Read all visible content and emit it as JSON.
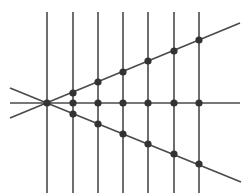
{
  "canvas": {
    "width": 248,
    "height": 196,
    "background": "#ffffff"
  },
  "style": {
    "line_color": "#4a4a4a",
    "line_width": 1.6,
    "node_color": "#333333",
    "node_radius": 3.6
  },
  "header": {
    "text_visible": false,
    "note": ""
  },
  "diagram": {
    "center": {
      "x": 47,
      "y": 103
    },
    "vertical_lines": [
      {
        "x": 47,
        "y1": 12,
        "y2": 193
      },
      {
        "x": 73,
        "y1": 12,
        "y2": 193
      },
      {
        "x": 98,
        "y1": 12,
        "y2": 193
      },
      {
        "x": 123,
        "y1": 12,
        "y2": 193
      },
      {
        "x": 148,
        "y1": 12,
        "y2": 193
      },
      {
        "x": 174,
        "y1": 12,
        "y2": 193
      },
      {
        "x": 199,
        "y1": 12,
        "y2": 193
      }
    ],
    "transversals": [
      {
        "name": "upper-line",
        "x1": 10,
        "y1": 118,
        "x2": 240,
        "y2": 23
      },
      {
        "name": "horizontal-line",
        "x1": 10,
        "y1": 103,
        "x2": 240,
        "y2": 103
      },
      {
        "name": "lower-line",
        "x1": 10,
        "y1": 88,
        "x2": 241,
        "y2": 182
      }
    ],
    "nodes": [
      {
        "x": 47,
        "y": 103
      },
      {
        "x": 73,
        "y": 93
      },
      {
        "x": 73,
        "y": 103
      },
      {
        "x": 73,
        "y": 114
      },
      {
        "x": 98,
        "y": 82
      },
      {
        "x": 98,
        "y": 103
      },
      {
        "x": 98,
        "y": 124
      },
      {
        "x": 123,
        "y": 72
      },
      {
        "x": 123,
        "y": 103
      },
      {
        "x": 123,
        "y": 134
      },
      {
        "x": 148,
        "y": 61
      },
      {
        "x": 148,
        "y": 103
      },
      {
        "x": 148,
        "y": 144
      },
      {
        "x": 174,
        "y": 51
      },
      {
        "x": 174,
        "y": 103
      },
      {
        "x": 174,
        "y": 154
      },
      {
        "x": 199,
        "y": 40
      },
      {
        "x": 199,
        "y": 103
      },
      {
        "x": 199,
        "y": 164
      }
    ]
  }
}
